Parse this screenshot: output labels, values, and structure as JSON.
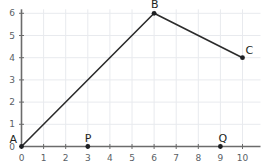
{
  "chart_data": {
    "type": "line",
    "title": "",
    "xlabel": "",
    "ylabel": "",
    "xlim": [
      0,
      10
    ],
    "ylim": [
      0,
      6
    ],
    "grid": true,
    "legend": null,
    "xticks": [
      "0",
      "1",
      "2",
      "3",
      "4",
      "5",
      "6",
      "7",
      "8",
      "9",
      "10"
    ],
    "yticks": [
      "0",
      "1",
      "2",
      "3",
      "4",
      "5",
      "6"
    ],
    "xtick_values": [
      0,
      1,
      2,
      3,
      4,
      5,
      6,
      7,
      8,
      9,
      10
    ],
    "ytick_values": [
      0,
      1,
      2,
      3,
      4,
      5,
      6
    ],
    "series": [
      {
        "name": "path-ABC",
        "x": [
          0,
          6,
          10
        ],
        "y": [
          0,
          6,
          4
        ]
      }
    ],
    "annotations": [
      {
        "label": "A",
        "x": 0,
        "y": 0,
        "marker": true,
        "label_dx": -12,
        "label_dy": -13
      },
      {
        "label": "B",
        "x": 6,
        "y": 6,
        "marker": true,
        "label_dx": -3,
        "label_dy": -14
      },
      {
        "label": "C",
        "x": 10,
        "y": 4,
        "marker": true,
        "label_dx": 3,
        "label_dy": -13
      },
      {
        "label": "P",
        "x": 3,
        "y": 0,
        "marker": true,
        "label_dx": -3,
        "label_dy": -14
      },
      {
        "label": "Q",
        "x": 9,
        "y": 0,
        "marker": true,
        "label_dx": -2,
        "label_dy": -14
      }
    ],
    "colors": {
      "line": "#2b2b2b",
      "axis": "#6b6b6b",
      "grid": "#e8eaee",
      "tick_text": "#5a5f66",
      "point_label": "#1d1f22",
      "marker": "#1d1f22",
      "background": "#ffffff"
    }
  }
}
